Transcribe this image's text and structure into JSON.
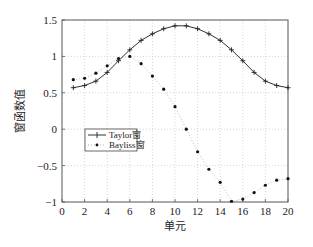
{
  "chart_data": {
    "type": "line",
    "title": "",
    "xlabel": "单元",
    "ylabel": "窗函数值",
    "xlim": [
      0,
      20
    ],
    "ylim": [
      -1,
      1.5
    ],
    "xticks": [
      0,
      2,
      4,
      6,
      8,
      10,
      12,
      14,
      16,
      18,
      20
    ],
    "yticks": [
      -1,
      -0.5,
      0,
      0.5,
      1,
      1.5
    ],
    "xtick_labels": [
      "0",
      "2",
      "4",
      "6",
      "8",
      "10",
      "12",
      "14",
      "16",
      "18",
      "20"
    ],
    "ytick_labels": [
      "−1",
      "−0.5",
      "0",
      "0.5",
      "1",
      "1.5"
    ],
    "grid": true,
    "legend_position": "center-left",
    "x": [
      1,
      2,
      3,
      4,
      5,
      6,
      7,
      8,
      9,
      10,
      11,
      12,
      13,
      14,
      15,
      16,
      17,
      18,
      19,
      20
    ],
    "series": [
      {
        "name": "Taylor窗",
        "style": "solid line with plus markers",
        "color": "#333333",
        "values": [
          0.57,
          0.6,
          0.66,
          0.78,
          0.94,
          1.09,
          1.22,
          1.31,
          1.38,
          1.42,
          1.42,
          1.38,
          1.31,
          1.22,
          1.09,
          0.94,
          0.78,
          0.66,
          0.6,
          0.57
        ]
      },
      {
        "name": "Bayliss窗",
        "style": "dotted line with dot markers",
        "color": "#111111",
        "values": [
          0.68,
          0.7,
          0.77,
          0.87,
          0.97,
          1.0,
          0.9,
          0.73,
          0.55,
          0.31,
          0.0,
          -0.31,
          -0.55,
          -0.73,
          -0.99,
          -0.96,
          -0.87,
          -0.77,
          -0.7,
          -0.68
        ]
      }
    ]
  }
}
